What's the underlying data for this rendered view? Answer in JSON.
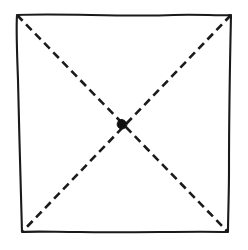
{
  "figure": {
    "title": "Hand-drawn square with dashed diagonals and center point",
    "background_color": "#ffffff",
    "stroke_color": "#1a1a1a",
    "canvas": {
      "width": 248,
      "height": 250
    },
    "shapes": {
      "square": {
        "name": "hand-drawn-square",
        "style": "solid",
        "stroke_width": 2.1,
        "corners": {
          "top_left": [
            17,
            15
          ],
          "top_right": [
            231,
            15
          ],
          "bottom_right": [
            228,
            232
          ],
          "bottom_left": [
            22,
            232
          ]
        },
        "path": "M17,15 C62,13 120,17 174,15 C199,14 218,16 231,15 C230,60 229,120 229,170 C229,196 228,216 228,232 C190,231 130,233 80,232 C56,232 36,231 22,232 C21,190 19,130 18,80 C17,52 16,30 17,15 Z"
      },
      "diagonal_nw_se": {
        "name": "dashed-diagonal-nw-se",
        "style": "dashed",
        "stroke_width": 2.6,
        "dash_length": 8,
        "gap_length": 5,
        "from": [
          17,
          15
        ],
        "to": [
          228,
          232
        ]
      },
      "diagonal_ne_sw": {
        "name": "dashed-diagonal-ne-sw",
        "style": "dashed",
        "stroke_width": 2.6,
        "dash_length": 8,
        "gap_length": 5,
        "from": [
          231,
          15
        ],
        "to": [
          22,
          232
        ]
      },
      "center_point": {
        "name": "center-intersection-dot",
        "style": "filled",
        "center": [
          122,
          124
        ],
        "radius": 4.2,
        "fill": "#111111"
      }
    }
  }
}
